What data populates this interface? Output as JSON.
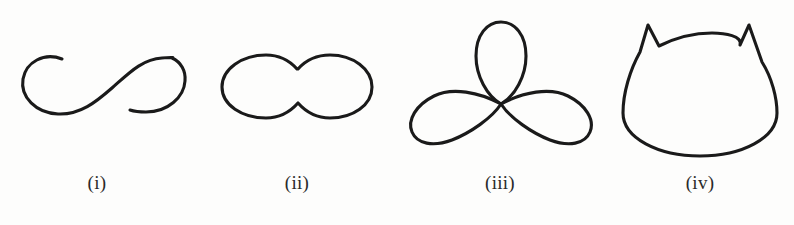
{
  "plate": {
    "background_color": "#fdfdfc",
    "stroke_color": "#1a1a1a",
    "stroke_width": 3.1,
    "width": 794,
    "height": 225
  },
  "figures": [
    {
      "label": "(i)",
      "name": "open-s-curve",
      "description": "Open lazy-eight / S-shaped curve with two free endpoints",
      "closed": false,
      "bbox": [
        22,
        55,
        172,
        115
      ]
    },
    {
      "label": "(ii)",
      "name": "peanut-curve",
      "description": "Closed peanut / dumbbell curve with pinched waist",
      "closed": true,
      "bbox": [
        222,
        55,
        372,
        118
      ]
    },
    {
      "label": "(iii)",
      "name": "trefoil-rose-curve",
      "description": "Three-petal rose with self-intersections forming central triangle",
      "closed": true,
      "bbox": [
        430,
        22,
        572,
        148
      ]
    },
    {
      "label": "(iv)",
      "name": "cat-head-curve",
      "description": "Closed rounded curve with two sharp corner cusps at top",
      "closed": true,
      "bbox": [
        623,
        25,
        776,
        155
      ]
    }
  ]
}
